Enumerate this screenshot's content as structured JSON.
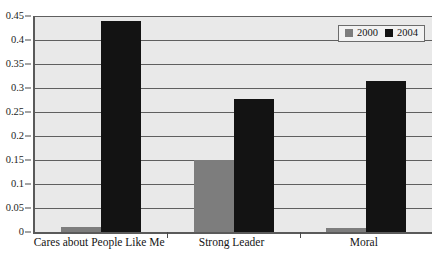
{
  "chart_data": {
    "type": "bar",
    "title": "",
    "subtitle": "",
    "xlabel": "",
    "ylabel": "",
    "categories": [
      "Cares about People Like Me",
      "Strong Leader",
      "Moral"
    ],
    "series": [
      {
        "name": "2000",
        "color": "#7d7d7d",
        "values": [
          0.011,
          0.15,
          0.008
        ]
      },
      {
        "name": "2004",
        "color": "#131313",
        "values": [
          0.44,
          0.278,
          0.315
        ]
      }
    ],
    "ylim": [
      0,
      0.45
    ],
    "ytick_labels": [
      "0",
      "0.05",
      "0.1",
      "0.15",
      "0.2",
      "0.25",
      "0.3",
      "0.35",
      "0.4",
      "0.45"
    ],
    "ytick_values": [
      0,
      0.05,
      0.1,
      0.15,
      0.2,
      0.25,
      0.3,
      0.35,
      0.4,
      0.45
    ],
    "grid": true,
    "legend_position": "top-right",
    "legend_entries": [
      "2000",
      "2004"
    ],
    "plot_background": "#e9e9e9",
    "gridline_color": "#5f5f5f",
    "axis_color": "#5a5a5a"
  }
}
